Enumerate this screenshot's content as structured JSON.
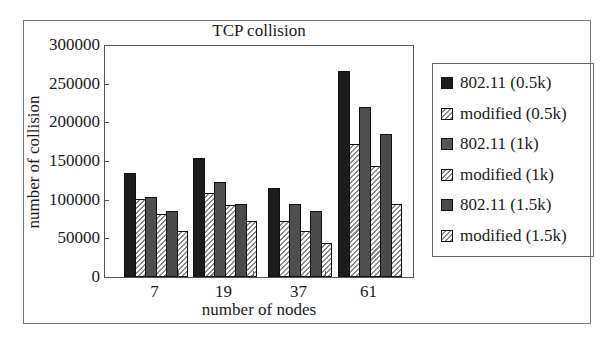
{
  "chart_data": {
    "type": "bar",
    "title": "TCP collision",
    "xlabel": "number of nodes",
    "ylabel": "number of collision",
    "categories": [
      "7",
      "19",
      "37",
      "61"
    ],
    "ylim": [
      0,
      300000
    ],
    "yticks": [
      0,
      50000,
      100000,
      150000,
      200000,
      250000,
      300000
    ],
    "ytick_labels": [
      "0",
      "50000",
      "100000",
      "150000",
      "200000",
      "250000",
      "300000"
    ],
    "grid": false,
    "legend_position": "right",
    "series": [
      {
        "name": "802.11 (0.5k)",
        "pattern": "solid-black",
        "values": [
          134000,
          154000,
          115000,
          267000
        ]
      },
      {
        "name": "modified (0.5k)",
        "pattern": "hatched",
        "values": [
          101000,
          108000,
          72000,
          172000
        ]
      },
      {
        "name": "802.11 (1k)",
        "pattern": "solid-gray",
        "values": [
          103000,
          123000,
          95000,
          220000
        ]
      },
      {
        "name": "modified (1k)",
        "pattern": "hatched",
        "values": [
          81000,
          93000,
          59000,
          143000
        ]
      },
      {
        "name": "802.11 (1.5k)",
        "pattern": "solid-darkgray",
        "values": [
          86000,
          95000,
          86000,
          185000
        ]
      },
      {
        "name": "modified (1.5k)",
        "pattern": "hatched",
        "values": [
          59000,
          72000,
          44000,
          95000
        ]
      }
    ]
  }
}
